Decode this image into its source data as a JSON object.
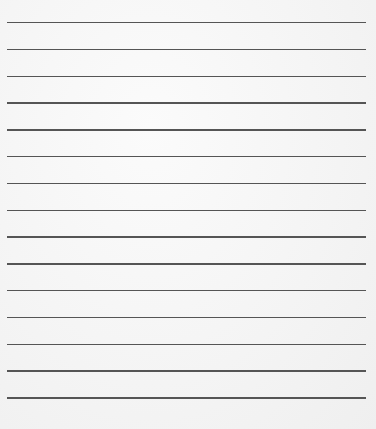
{
  "page": {
    "type": "lined-paper",
    "line_count": 15,
    "first_line_y": 22,
    "line_spacing": 26.8,
    "line_color": "#555555",
    "background_color": "#f7f7f7"
  }
}
